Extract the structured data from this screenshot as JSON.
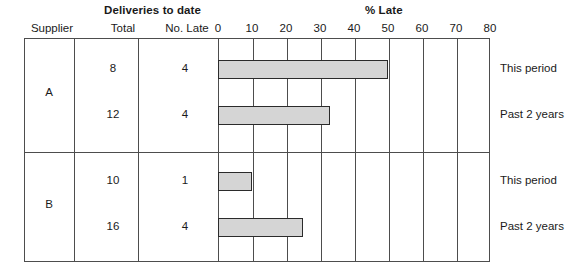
{
  "header": {
    "group_title": "Deliveries to date",
    "axis_title": "% Late",
    "columns": [
      {
        "label": "Supplier"
      },
      {
        "label": "Total"
      },
      {
        "label": "No. Late"
      }
    ]
  },
  "chart_data": {
    "type": "bar",
    "orientation": "horizontal",
    "title": "% Late",
    "xlabel": "% Late",
    "ylabel": "",
    "xlim": [
      0,
      80
    ],
    "xticks": [
      0,
      10,
      20,
      30,
      40,
      50,
      60,
      70,
      80
    ],
    "grid": true,
    "legend": "none",
    "categories": [
      "A – This period",
      "A – Past 2 years",
      "B – This period",
      "B – Past 2 years"
    ],
    "values": [
      50,
      33,
      10,
      25
    ],
    "series": [
      {
        "name": "% Late",
        "values": [
          50,
          33,
          10,
          25
        ]
      }
    ],
    "bar_color": "#d5d5d5",
    "bar_edge_color": "#2b2b2b"
  },
  "table": {
    "groups": [
      {
        "supplier": "A",
        "rows": [
          {
            "total": "8",
            "no_late": "4",
            "period": "This period",
            "pct_late": 50
          },
          {
            "total": "12",
            "no_late": "4",
            "period": "Past 2 years",
            "pct_late": 33
          }
        ]
      },
      {
        "supplier": "B",
        "rows": [
          {
            "total": "10",
            "no_late": "1",
            "period": "This period",
            "pct_late": 10
          },
          {
            "total": "16",
            "no_late": "4",
            "period": "Past 2 years",
            "pct_late": 25
          }
        ]
      }
    ]
  },
  "axis": {
    "ticks": [
      "0",
      "10",
      "20",
      "30",
      "40",
      "50",
      "60",
      "70",
      "80"
    ]
  },
  "colors": {
    "bar_fill": "#d5d5d5",
    "bar_stroke": "#2b2b2b",
    "grid_line": "#4d4d4d",
    "text": "#1a1a1a",
    "background": "#ffffff"
  }
}
